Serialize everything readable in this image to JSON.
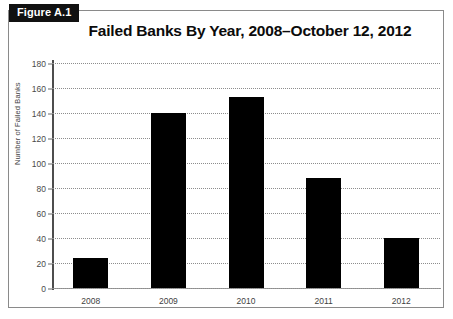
{
  "figure": {
    "tag": "Figure A.1",
    "title": "Failed Banks By Year, 2008–October 12, 2012"
  },
  "chart_data": {
    "type": "bar",
    "title": "Failed Banks By Year, 2008–October 12, 2012",
    "categories": [
      "2008",
      "2009",
      "2010",
      "2011",
      "2012"
    ],
    "values": [
      24,
      140,
      153,
      88,
      40
    ],
    "series": [
      {
        "name": "Failed Banks",
        "values": [
          24,
          140,
          153,
          88,
          40
        ]
      }
    ],
    "xlabel": "",
    "ylabel": "Number of Failed Banks",
    "ylim": [
      0,
      180
    ],
    "ytick_step": 20,
    "yticks": [
      "0",
      "20",
      "40",
      "60",
      "80",
      "100",
      "120",
      "140",
      "160",
      "180"
    ],
    "grid": true,
    "grid_style": "dotted-horizontal",
    "legend": "none",
    "bar_color": "#000000"
  }
}
